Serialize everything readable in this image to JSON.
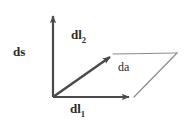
{
  "figure": {
    "type": "vector-parallelogram-diagram",
    "background_color": "#ffffff",
    "vector_color": "#4a4a4a",
    "thin_line_color": "#8c8c8c",
    "label_color": "#2b2b2b",
    "origin": {
      "x": 53,
      "y": 97
    },
    "vectors": [
      {
        "name": "ds",
        "label_text": "ds",
        "label_subscript": "",
        "style": "bold-arrow",
        "from": {
          "x": 53,
          "y": 97
        },
        "to": {
          "x": 53,
          "y": 12
        },
        "direction": "up"
      },
      {
        "name": "dl2",
        "label_text": "dl",
        "label_subscript": "2",
        "style": "bold-arrow",
        "from": {
          "x": 53,
          "y": 97
        },
        "to": {
          "x": 114,
          "y": 54
        },
        "direction": "up-right"
      },
      {
        "name": "dl1",
        "label_text": "dl",
        "label_subscript": "1",
        "style": "bold-arrow",
        "from": {
          "x": 53,
          "y": 97
        },
        "to": {
          "x": 134,
          "y": 97
        },
        "direction": "right"
      }
    ],
    "area_patch": {
      "name": "da",
      "label_text": "da",
      "thin_edges": [
        {
          "from": {
            "x": 114,
            "y": 54
          },
          "to": {
            "x": 177,
            "y": 53
          }
        },
        {
          "from": {
            "x": 177,
            "y": 53
          },
          "to": {
            "x": 134,
            "y": 97
          }
        }
      ]
    },
    "labels": [
      {
        "id": "ds",
        "text": "ds",
        "subscript": "",
        "bold": true,
        "x": 13,
        "y": 45
      },
      {
        "id": "dl2",
        "text": "dl",
        "subscript": "2",
        "bold": true,
        "x": 71,
        "y": 28
      },
      {
        "id": "dl1",
        "text": "dl",
        "subscript": "1",
        "bold": true,
        "x": 70,
        "y": 102
      },
      {
        "id": "da",
        "text": "da",
        "subscript": "",
        "bold": false,
        "x": 118,
        "y": 61
      }
    ]
  }
}
